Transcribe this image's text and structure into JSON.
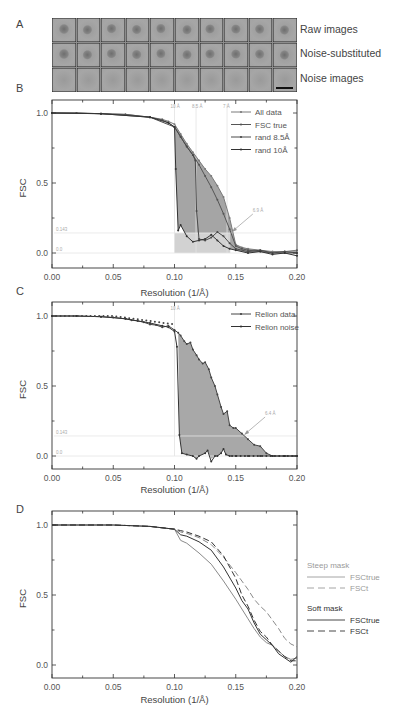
{
  "panel_a": {
    "letter": "A",
    "rows": [
      {
        "label": "Raw images",
        "type": "particle"
      },
      {
        "label": "Noise-substituted",
        "type": "particle"
      },
      {
        "label": "Noise images",
        "type": "noise"
      }
    ],
    "columns": 10,
    "scale_bar": true
  },
  "panel_b": {
    "letter": "B"
  },
  "panel_c": {
    "letter": "C"
  },
  "panel_d": {
    "letter": "D"
  },
  "chart_data": [
    {
      "id": "B",
      "type": "line",
      "title": "",
      "xlabel": "Resolution (1/Å)",
      "ylabel": "FSC",
      "xlim": [
        0.0,
        0.2
      ],
      "ylim": [
        -0.1,
        1.05
      ],
      "xticks": [
        "0.00",
        "0.05",
        "0.10",
        "0.15",
        "0.20"
      ],
      "yticks": [
        "0.0",
        "0.5",
        "1.0"
      ],
      "grid": false,
      "legend_position": "upper right",
      "legend": [
        "All data",
        "FSC true",
        "rand 8.5Å",
        "rand 10Å"
      ],
      "vertical_markers": [
        {
          "x": 0.1,
          "label": "10 Å"
        },
        {
          "x": 0.1176,
          "label": "8.5 Å"
        },
        {
          "x": 0.1429,
          "label": "7 Å"
        }
      ],
      "horizontal_markers": [
        {
          "y": 0.143,
          "label": "0.143"
        },
        {
          "y": 0.0,
          "label": "0.0"
        }
      ],
      "annotation": {
        "text": "6.9 Å",
        "x": 0.146,
        "y": 0.15
      },
      "series": [
        {
          "name": "All data",
          "x": [
            0.0,
            0.02,
            0.04,
            0.06,
            0.08,
            0.09,
            0.095,
            0.1,
            0.105,
            0.11,
            0.115,
            0.12,
            0.125,
            0.13,
            0.135,
            0.14,
            0.145,
            0.15,
            0.155,
            0.16,
            0.17,
            0.18,
            0.19,
            0.2
          ],
          "y": [
            1.0,
            1.0,
            0.995,
            0.99,
            0.97,
            0.955,
            0.94,
            0.92,
            0.85,
            0.78,
            0.72,
            0.66,
            0.6,
            0.55,
            0.48,
            0.4,
            0.25,
            0.06,
            0.04,
            0.03,
            0.02,
            0.01,
            0.01,
            0.02
          ]
        },
        {
          "name": "FSC true",
          "x": [
            0.0,
            0.02,
            0.04,
            0.06,
            0.08,
            0.09,
            0.095,
            0.1,
            0.105,
            0.11,
            0.115,
            0.12,
            0.125,
            0.13,
            0.135,
            0.14,
            0.145,
            0.15,
            0.155,
            0.16,
            0.17,
            0.18,
            0.19,
            0.2
          ],
          "y": [
            1.0,
            1.0,
            0.995,
            0.99,
            0.97,
            0.95,
            0.93,
            0.9,
            0.83,
            0.76,
            0.7,
            0.63,
            0.55,
            0.47,
            0.38,
            0.28,
            0.17,
            0.05,
            0.03,
            0.02,
            0.01,
            0.0,
            0.0,
            0.0
          ]
        },
        {
          "name": "rand 8.5Å",
          "x": [
            0.0,
            0.04,
            0.08,
            0.1,
            0.105,
            0.11,
            0.115,
            0.117,
            0.118,
            0.12,
            0.125,
            0.13,
            0.135,
            0.14,
            0.145,
            0.15,
            0.16,
            0.17,
            0.18,
            0.19,
            0.2
          ],
          "y": [
            1.0,
            0.995,
            0.97,
            0.9,
            0.83,
            0.76,
            0.7,
            0.66,
            0.3,
            0.1,
            0.09,
            0.11,
            0.15,
            0.12,
            0.07,
            0.03,
            0.01,
            0.02,
            0.0,
            0.01,
            0.0
          ]
        },
        {
          "name": "rand 10Å",
          "x": [
            0.0,
            0.04,
            0.08,
            0.095,
            0.1,
            0.101,
            0.103,
            0.105,
            0.11,
            0.115,
            0.12,
            0.125,
            0.13,
            0.135,
            0.14,
            0.145,
            0.15,
            0.16,
            0.17,
            0.18,
            0.19,
            0.2
          ],
          "y": [
            1.0,
            0.995,
            0.97,
            0.93,
            0.9,
            0.6,
            0.16,
            0.2,
            0.12,
            0.08,
            0.09,
            0.1,
            0.13,
            0.09,
            0.05,
            0.03,
            0.02,
            0.0,
            0.01,
            -0.01,
            0.0,
            -0.02
          ]
        }
      ]
    },
    {
      "id": "C",
      "type": "line",
      "title": "",
      "xlabel": "Resolution (1/Å)",
      "ylabel": "FSC",
      "xlim": [
        0.0,
        0.2
      ],
      "ylim": [
        -0.1,
        1.05
      ],
      "xticks": [
        "0.00",
        "0.05",
        "0.10",
        "0.15",
        "0.20"
      ],
      "yticks": [
        "0.0",
        "0.5",
        "1.0"
      ],
      "grid": false,
      "legend_position": "upper right",
      "legend": [
        "Relion data",
        "Relion noise"
      ],
      "vertical_markers": [
        {
          "x": 0.1,
          "label": "10 Å"
        }
      ],
      "horizontal_markers": [
        {
          "y": 0.143,
          "label": "0.143"
        },
        {
          "y": 0.0,
          "label": "0.0"
        }
      ],
      "annotation": {
        "text": "6.4 Å",
        "x": 0.156,
        "y": 0.15
      },
      "series": [
        {
          "name": "Relion data",
          "x": [
            0.0,
            0.02,
            0.04,
            0.05,
            0.06,
            0.065,
            0.07,
            0.075,
            0.08,
            0.085,
            0.09,
            0.095,
            0.1,
            0.103,
            0.105,
            0.108,
            0.11,
            0.113,
            0.115,
            0.118,
            0.12,
            0.123,
            0.125,
            0.128,
            0.13,
            0.133,
            0.135,
            0.138,
            0.14,
            0.143,
            0.145,
            0.148,
            0.15,
            0.155,
            0.16,
            0.165,
            0.17,
            0.175,
            0.18,
            0.19,
            0.2
          ],
          "y": [
            1.0,
            1.0,
            0.995,
            0.99,
            0.98,
            0.97,
            0.965,
            0.955,
            0.94,
            0.935,
            0.92,
            0.93,
            0.9,
            0.88,
            0.86,
            0.82,
            0.8,
            0.81,
            0.76,
            0.72,
            0.69,
            0.66,
            0.67,
            0.62,
            0.56,
            0.5,
            0.44,
            0.35,
            0.3,
            0.32,
            0.22,
            0.2,
            0.2,
            0.16,
            0.12,
            0.08,
            0.07,
            0.02,
            0.0,
            0.0,
            0.0
          ]
        },
        {
          "name": "Relion noise",
          "x": [
            0.0,
            0.02,
            0.04,
            0.06,
            0.08,
            0.09,
            0.095,
            0.1,
            0.102,
            0.104,
            0.106,
            0.11,
            0.115,
            0.118,
            0.12,
            0.125,
            0.127,
            0.13,
            0.133,
            0.135,
            0.138,
            0.14,
            0.142,
            0.145,
            0.15,
            0.16,
            0.17,
            0.18,
            0.19,
            0.2
          ],
          "y": [
            1.0,
            1.0,
            0.995,
            0.98,
            0.95,
            0.93,
            0.92,
            0.89,
            0.78,
            0.15,
            0.02,
            0.01,
            0.0,
            -0.02,
            0.0,
            0.02,
            0.04,
            -0.04,
            0.0,
            0.0,
            0.02,
            0.05,
            0.01,
            0.0,
            0.0,
            0.0,
            0.0,
            0.0,
            0.0,
            0.0
          ]
        }
      ]
    },
    {
      "id": "D",
      "type": "line",
      "title": "",
      "xlabel": "Resolution (1/Å)",
      "ylabel": "FSC",
      "xlim": [
        0.0,
        0.2
      ],
      "ylim": [
        -0.1,
        1.05
      ],
      "xticks": [
        "0.00",
        "0.05",
        "0.10",
        "0.15",
        "0.20"
      ],
      "yticks": [
        "0.0",
        "0.5",
        "1.0"
      ],
      "grid": false,
      "legend_position": "right, outside",
      "legend_groups": [
        {
          "title": "Steep mask",
          "entries": [
            "FSCtrue",
            "FSCt"
          ]
        },
        {
          "title": "Soft mask",
          "entries": [
            "FSCtrue",
            "FSCt"
          ]
        }
      ],
      "series": [
        {
          "name": "Steep mask FSCtrue",
          "style": "solid",
          "color": "#8a8a8a",
          "x": [
            0.0,
            0.05,
            0.08,
            0.1,
            0.105,
            0.11,
            0.12,
            0.13,
            0.14,
            0.15,
            0.155,
            0.16,
            0.165,
            0.17,
            0.175,
            0.18,
            0.185,
            0.19,
            0.195,
            0.2
          ],
          "y": [
            1.0,
            1.0,
            0.99,
            0.97,
            0.89,
            0.87,
            0.8,
            0.72,
            0.6,
            0.47,
            0.4,
            0.33,
            0.26,
            0.2,
            0.16,
            0.14,
            0.1,
            0.06,
            0.04,
            0.05
          ]
        },
        {
          "name": "Steep mask FSCt",
          "style": "dashed",
          "color": "#8a8a8a",
          "x": [
            0.0,
            0.05,
            0.08,
            0.1,
            0.105,
            0.11,
            0.12,
            0.13,
            0.14,
            0.15,
            0.155,
            0.16,
            0.165,
            0.17,
            0.175,
            0.18,
            0.185,
            0.19,
            0.195,
            0.2
          ],
          "y": [
            1.0,
            1.0,
            0.99,
            0.97,
            0.95,
            0.94,
            0.91,
            0.86,
            0.77,
            0.66,
            0.6,
            0.54,
            0.47,
            0.42,
            0.38,
            0.32,
            0.26,
            0.19,
            0.15,
            0.13
          ]
        },
        {
          "name": "Soft mask FSCtrue",
          "style": "solid",
          "color": "#333333",
          "x": [
            0.0,
            0.05,
            0.08,
            0.1,
            0.105,
            0.11,
            0.12,
            0.13,
            0.14,
            0.15,
            0.155,
            0.16,
            0.165,
            0.17,
            0.175,
            0.18,
            0.185,
            0.19,
            0.195,
            0.2
          ],
          "y": [
            1.0,
            1.0,
            0.99,
            0.97,
            0.93,
            0.92,
            0.88,
            0.82,
            0.7,
            0.55,
            0.46,
            0.4,
            0.3,
            0.22,
            0.18,
            0.14,
            0.08,
            0.05,
            0.02,
            0.06
          ]
        },
        {
          "name": "Soft mask FSCt",
          "style": "dashed",
          "color": "#333333",
          "x": [
            0.0,
            0.05,
            0.08,
            0.1,
            0.105,
            0.11,
            0.12,
            0.13,
            0.14,
            0.15,
            0.155,
            0.16,
            0.165,
            0.17,
            0.175,
            0.18,
            0.185,
            0.19,
            0.195,
            0.2
          ],
          "y": [
            1.0,
            1.0,
            0.99,
            0.97,
            0.96,
            0.95,
            0.92,
            0.88,
            0.78,
            0.62,
            0.5,
            0.42,
            0.32,
            0.24,
            0.2,
            0.14,
            0.1,
            0.06,
            0.03,
            0.03
          ]
        }
      ]
    }
  ]
}
